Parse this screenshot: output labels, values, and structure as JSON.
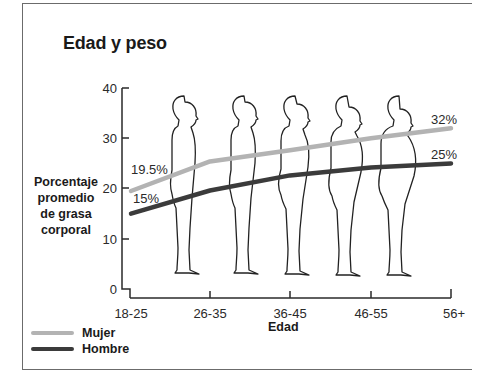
{
  "chart_data": {
    "type": "line",
    "title": "Edad y peso",
    "xlabel": "Edad",
    "ylabel": "Porcentaje promedio de grasa corporal",
    "ylabel_lines": [
      "Porcentaje",
      "promedio",
      "de grasa",
      "corporal"
    ],
    "categories": [
      "18-25",
      "26-35",
      "36-45",
      "46-55",
      "56+"
    ],
    "ylim": [
      0,
      40
    ],
    "yticks": [
      0,
      10,
      20,
      30,
      40
    ],
    "grid": false,
    "legend_position": "bottom-left",
    "series": [
      {
        "name": "Mujer",
        "color": "#b3b3b3",
        "values": [
          19.5,
          25.4,
          27.6,
          30.0,
          32.0
        ],
        "labels": {
          "start": "19.5%",
          "end": "32%"
        }
      },
      {
        "name": "Hombre",
        "color": "#3b3b3b",
        "values": [
          15.0,
          19.6,
          22.6,
          24.2,
          25.0
        ],
        "labels": {
          "start": "15%",
          "end": "25%"
        }
      }
    ],
    "annotations": [
      "19.5%",
      "15%",
      "32%",
      "25%"
    ],
    "illustration": "five human silhouettes in profile, increasingly heavier with age"
  },
  "legend": {
    "items": [
      {
        "label": "Mujer",
        "color": "#b3b3b3"
      },
      {
        "label": "Hombre",
        "color": "#3b3b3b"
      }
    ]
  }
}
